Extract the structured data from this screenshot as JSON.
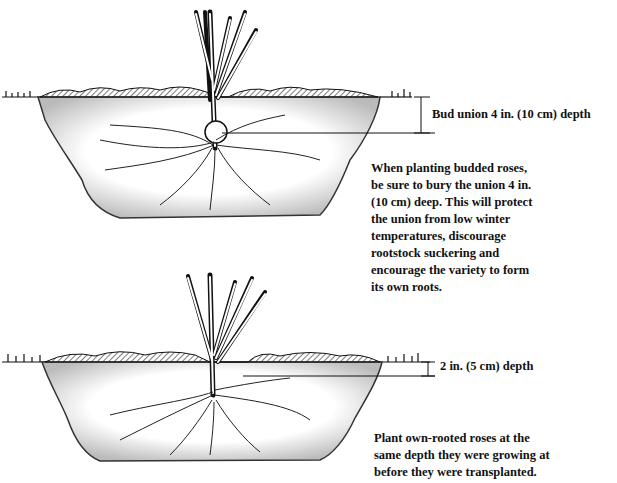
{
  "figures": [
    {
      "name": "budded-rose-planting",
      "depth_label": "Bud union 4 in. (10 cm) depth",
      "caption_lines": [
        "When planting budded roses,",
        "be sure to bury the union 4 in.",
        "(10 cm) deep. This will protect",
        "the union from low winter",
        "temperatures, discourage",
        "rootstock suckering and",
        "encourage the variety to form",
        "its own roots."
      ]
    },
    {
      "name": "own-rooted-rose-planting",
      "depth_label": "2 in. (5 cm) depth",
      "caption_lines": [
        "Plant own-rooted roses at the",
        "same depth they were growing at",
        "before they were transplanted."
      ]
    }
  ],
  "colors": {
    "ink": "#111111",
    "soil_fill": "#f2f2f2",
    "paper": "#ffffff"
  }
}
